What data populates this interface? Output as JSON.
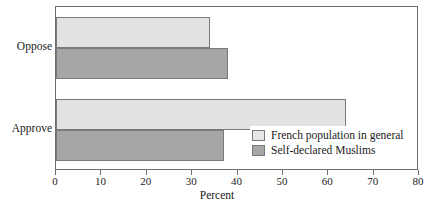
{
  "chart_data": {
    "type": "bar",
    "orientation": "horizontal",
    "title": "",
    "xlabel": "Percent",
    "ylabel": "",
    "xlim": [
      0,
      80
    ],
    "xticks": [
      0,
      10,
      20,
      30,
      40,
      50,
      60,
      70,
      80
    ],
    "xtick_labels": [
      "0",
      "10",
      "20",
      "30",
      "40",
      "50",
      "60",
      "70",
      "80"
    ],
    "categories": [
      "Oppose",
      "Approve"
    ],
    "grid": false,
    "legend_position": "inside-lower-right",
    "series": [
      {
        "name": "French population in general",
        "color": "#e2e2e2",
        "values": [
          34,
          64
        ]
      },
      {
        "name": "Self-declared Muslims",
        "color": "#a6a6a6",
        "values": [
          38,
          37
        ]
      }
    ]
  },
  "axis": {
    "x_title": "Percent",
    "tick_labels": [
      "0",
      "10",
      "20",
      "30",
      "40",
      "50",
      "60",
      "70",
      "80"
    ],
    "category_labels": [
      "Oppose",
      "Approve"
    ]
  },
  "legend": {
    "items": [
      {
        "label": "French population in general",
        "swatch": "light"
      },
      {
        "label": "Self-declared Muslims",
        "swatch": "dark"
      }
    ]
  },
  "top_caption_remnant": ""
}
